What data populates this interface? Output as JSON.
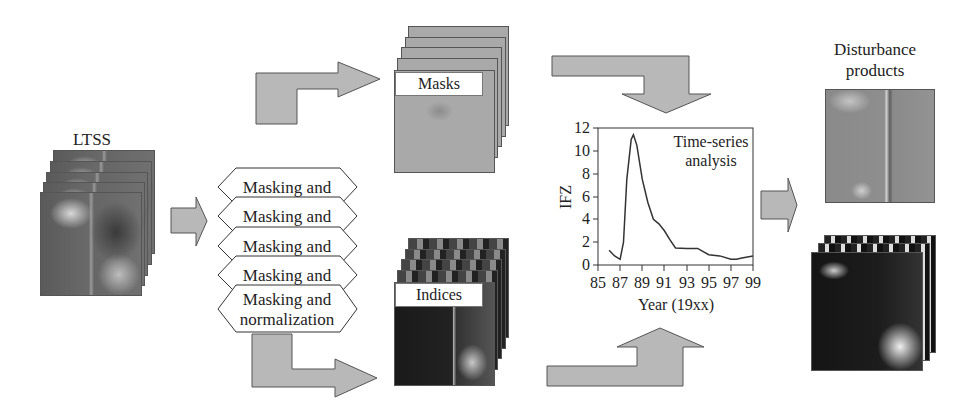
{
  "diagram": {
    "inputs": {
      "ltss_label": "LTSS",
      "stack_count": 5
    },
    "processing": {
      "steps": [
        {
          "label": "Masking and"
        },
        {
          "label": "Masking and"
        },
        {
          "label": "Masking and"
        },
        {
          "label": "Masking and"
        },
        {
          "label_line1": "Masking and",
          "label_line2": "normalization"
        }
      ]
    },
    "intermediates": {
      "masks_label": "Masks",
      "indices_label": "Indices"
    },
    "analysis": {
      "annotation_line1": "Time-series",
      "annotation_line2": "analysis"
    },
    "outputs": {
      "title_line1": "Disturbance",
      "title_line2": "products"
    },
    "colors": {
      "arrow_fill": "#b8b8b8",
      "arrow_stroke": "#555555",
      "line": "#333333"
    }
  },
  "chart_data": {
    "type": "line",
    "title": "Time-series analysis",
    "xlabel": "Year (19xx)",
    "ylabel": "IFZ",
    "xlim": [
      85,
      99
    ],
    "ylim": [
      0,
      12
    ],
    "x_ticks": [
      "85",
      "87",
      "89",
      "91",
      "93",
      "95",
      "97",
      "99"
    ],
    "y_ticks": [
      "0",
      "2",
      "4",
      "6",
      "8",
      "10",
      "12"
    ],
    "grid": false,
    "legend": null,
    "series": [
      {
        "name": "IFZ",
        "x": [
          86,
          86.5,
          87,
          87.3,
          87.6,
          88,
          88.2,
          88.5,
          89,
          89.5,
          90,
          90.5,
          91,
          91.5,
          92,
          93,
          94,
          95,
          96,
          97,
          97.5,
          98,
          99
        ],
        "values": [
          1.3,
          0.8,
          0.5,
          2.0,
          7.5,
          11.0,
          11.4,
          10.5,
          7.5,
          5.5,
          4.0,
          3.6,
          3.0,
          2.2,
          1.5,
          1.45,
          1.45,
          0.9,
          0.8,
          0.5,
          0.5,
          0.6,
          0.8
        ]
      }
    ]
  }
}
